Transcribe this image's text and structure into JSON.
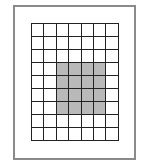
{
  "diagram": {
    "type": "grid",
    "rows": 9,
    "columns": 7,
    "shaded_region": {
      "row_start": 3,
      "row_end": 6,
      "col_start": 2,
      "col_end": 5
    },
    "colors": {
      "frame": "#8a8a8a",
      "grid_line": "#222222",
      "cell_fill": "#ffffff",
      "shaded_fill": "#b9b9b9"
    }
  }
}
